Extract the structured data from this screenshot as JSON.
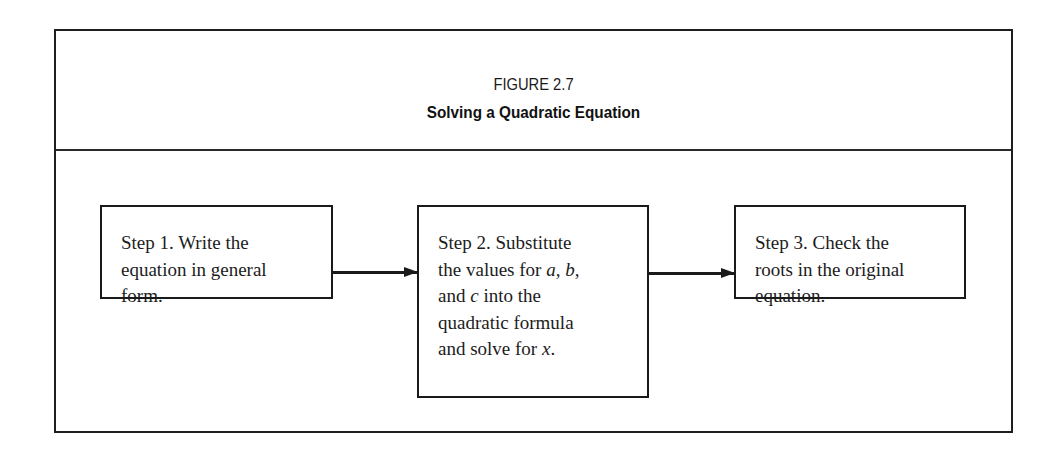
{
  "figure": {
    "label": "FIGURE 2.7",
    "title": "Solving a Quadratic Equation"
  },
  "steps": [
    {
      "label": "Step 1",
      "lines": [
        "Step 1. Write the",
        "equation in general",
        "form."
      ]
    },
    {
      "label": "Step 2",
      "lines": [
        "Step 2. Substitute",
        "the values for a, b,",
        "and c into the",
        "quadratic formula",
        "and solve for x."
      ],
      "italic_vars": [
        "a",
        "b",
        "c",
        "x"
      ]
    },
    {
      "label": "Step 3",
      "lines": [
        "Step 3. Check the",
        "roots in the original",
        "equation."
      ]
    }
  ],
  "connectors": [
    {
      "from": "Step 1",
      "to": "Step 2",
      "type": "arrow"
    },
    {
      "from": "Step 2",
      "to": "Step 3",
      "type": "arrow"
    }
  ],
  "colors": {
    "stroke": "#1a1a1a",
    "background": "#ffffff"
  }
}
